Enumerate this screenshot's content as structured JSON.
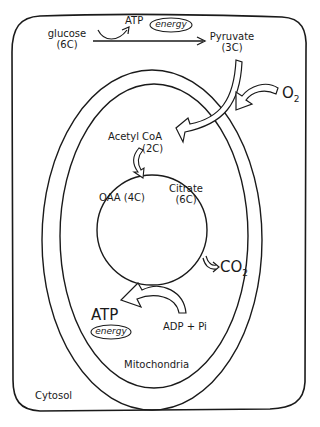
{
  "diagram": {
    "regions": {
      "cytosol": "Cytosol",
      "mitochondria": "Mitochondria"
    },
    "glycolysis": {
      "input_name": "glucose",
      "input_carbons": "(6C)",
      "byproduct": "ATP",
      "byproduct_tag": "energy",
      "output_name": "Pyruvate",
      "output_carbons": "(3C)"
    },
    "oxygen": {
      "symbol": "O",
      "subscript": "2"
    },
    "krebs": {
      "entry_name": "Acetyl CoA",
      "entry_carbons": "(2C)",
      "oaa": "OAA (4C)",
      "citrate_name": "Citrate",
      "citrate_carbons": "(6C)",
      "co2_symbol": "CO",
      "co2_subscript": "2"
    },
    "atp_synthesis": {
      "output": "ATP",
      "output_tag": "energy",
      "input": "ADP + Pi"
    },
    "colors": {
      "stroke": "#1a1a1a",
      "background": "#ffffff"
    }
  }
}
